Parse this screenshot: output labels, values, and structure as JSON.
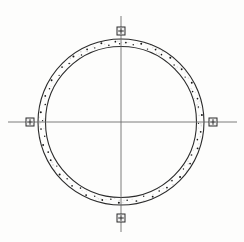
{
  "drawing": {
    "title": "Annular ring plan with centerlines and survey markers",
    "canvas": {
      "width": 244,
      "height": 242,
      "background": "#fdfdfc"
    },
    "center": {
      "x": 121,
      "y": 122
    },
    "colors": {
      "line": "#2b2b2b",
      "centerline": "#6e6e6e",
      "marker_fill": "#f2f2f2",
      "marker_stroke": "#2b2b2b",
      "dot": "#1a1a1a",
      "speckle": "#b9b9b9"
    },
    "outer_circle": {
      "label": "outer-circle",
      "radius": 83,
      "stroke_width": 1.1
    },
    "inner_circle": {
      "label": "inner-circle",
      "radius": 75.5,
      "stroke_width": 1.1
    },
    "centerlines": [
      {
        "label": "vertical-centerline",
        "x1": 121,
        "y1": 16,
        "x2": 121,
        "y2": 232,
        "width": 0.9
      },
      {
        "label": "horizontal-centerline",
        "x1": 8,
        "y1": 122,
        "x2": 237,
        "y2": 122,
        "width": 0.9
      }
    ],
    "markers": [
      {
        "label": "marker-north",
        "position": "top",
        "x": 121,
        "y": 31,
        "size": 8
      },
      {
        "label": "marker-south",
        "position": "bottom",
        "x": 121,
        "y": 218,
        "size": 8
      },
      {
        "label": "marker-west",
        "position": "left",
        "x": 30,
        "y": 122,
        "size": 8
      },
      {
        "label": "marker-east",
        "position": "right",
        "x": 213,
        "y": 122,
        "size": 8
      }
    ],
    "annulus_dots": {
      "label": "rebar-dots",
      "count": 62,
      "radius_range": [
        76.6,
        82.2
      ],
      "size_range": [
        1.1,
        2.1
      ],
      "points": [
        {
          "a": 3.5,
          "r": 79.6,
          "s": 1.8
        },
        {
          "a": 9.0,
          "r": 78.1,
          "s": 1.5
        },
        {
          "a": 14.5,
          "r": 80.8,
          "s": 1.9
        },
        {
          "a": 20.0,
          "r": 77.6,
          "s": 1.4
        },
        {
          "a": 25.5,
          "r": 80.2,
          "s": 1.7
        },
        {
          "a": 31.0,
          "r": 78.6,
          "s": 1.6
        },
        {
          "a": 37.5,
          "r": 81.0,
          "s": 2.0
        },
        {
          "a": 43.0,
          "r": 77.9,
          "s": 1.5
        },
        {
          "a": 49.0,
          "r": 80.4,
          "s": 1.8
        },
        {
          "a": 55.0,
          "r": 78.3,
          "s": 1.4
        },
        {
          "a": 61.0,
          "r": 80.9,
          "s": 1.9
        },
        {
          "a": 67.0,
          "r": 77.8,
          "s": 1.6
        },
        {
          "a": 73.0,
          "r": 80.0,
          "s": 1.7
        },
        {
          "a": 79.0,
          "r": 78.8,
          "s": 1.5
        },
        {
          "a": 85.0,
          "r": 81.2,
          "s": 2.0
        },
        {
          "a": 91.0,
          "r": 77.5,
          "s": 1.4
        },
        {
          "a": 97.0,
          "r": 80.3,
          "s": 1.8
        },
        {
          "a": 103.0,
          "r": 78.4,
          "s": 1.6
        },
        {
          "a": 109.0,
          "r": 81.0,
          "s": 1.9
        },
        {
          "a": 115.0,
          "r": 77.9,
          "s": 1.5
        },
        {
          "a": 121.0,
          "r": 80.6,
          "s": 1.7
        },
        {
          "a": 127.0,
          "r": 78.2,
          "s": 1.4
        },
        {
          "a": 133.0,
          "r": 80.8,
          "s": 2.0
        },
        {
          "a": 139.0,
          "r": 77.7,
          "s": 1.6
        },
        {
          "a": 145.0,
          "r": 80.1,
          "s": 1.8
        },
        {
          "a": 151.0,
          "r": 78.9,
          "s": 1.5
        },
        {
          "a": 157.0,
          "r": 81.1,
          "s": 1.9
        },
        {
          "a": 163.0,
          "r": 77.6,
          "s": 1.4
        },
        {
          "a": 169.0,
          "r": 80.5,
          "s": 1.7
        },
        {
          "a": 175.5,
          "r": 78.5,
          "s": 1.6
        },
        {
          "a": 181.5,
          "r": 80.9,
          "s": 2.0
        },
        {
          "a": 187.5,
          "r": 77.8,
          "s": 1.5
        },
        {
          "a": 193.5,
          "r": 80.2,
          "s": 1.8
        },
        {
          "a": 199.5,
          "r": 78.7,
          "s": 1.4
        },
        {
          "a": 205.5,
          "r": 81.0,
          "s": 1.9
        },
        {
          "a": 211.5,
          "r": 77.5,
          "s": 1.6
        },
        {
          "a": 217.5,
          "r": 80.4,
          "s": 1.7
        },
        {
          "a": 223.5,
          "r": 78.3,
          "s": 1.5
        },
        {
          "a": 229.5,
          "r": 80.7,
          "s": 2.0
        },
        {
          "a": 235.5,
          "r": 77.9,
          "s": 1.4
        },
        {
          "a": 241.5,
          "r": 80.0,
          "s": 1.8
        },
        {
          "a": 247.5,
          "r": 78.8,
          "s": 1.6
        },
        {
          "a": 253.5,
          "r": 81.2,
          "s": 1.9
        },
        {
          "a": 259.5,
          "r": 77.6,
          "s": 1.5
        },
        {
          "a": 265.0,
          "r": 80.3,
          "s": 1.7
        },
        {
          "a": 271.0,
          "r": 78.4,
          "s": 1.4
        },
        {
          "a": 277.0,
          "r": 80.8,
          "s": 2.0
        },
        {
          "a": 283.0,
          "r": 77.7,
          "s": 1.6
        },
        {
          "a": 289.0,
          "r": 80.1,
          "s": 1.8
        },
        {
          "a": 295.0,
          "r": 78.9,
          "s": 1.5
        },
        {
          "a": 301.0,
          "r": 81.0,
          "s": 1.9
        },
        {
          "a": 307.0,
          "r": 77.5,
          "s": 1.4
        },
        {
          "a": 313.0,
          "r": 80.6,
          "s": 1.7
        },
        {
          "a": 318.5,
          "r": 78.2,
          "s": 1.6
        },
        {
          "a": 324.0,
          "r": 80.9,
          "s": 2.0
        },
        {
          "a": 329.5,
          "r": 77.8,
          "s": 1.5
        },
        {
          "a": 335.0,
          "r": 80.2,
          "s": 1.8
        },
        {
          "a": 340.5,
          "r": 78.6,
          "s": 1.4
        },
        {
          "a": 346.0,
          "r": 81.1,
          "s": 1.9
        },
        {
          "a": 351.0,
          "r": 77.6,
          "s": 1.6
        },
        {
          "a": 356.0,
          "r": 80.5,
          "s": 1.7
        },
        {
          "a": 359.0,
          "r": 78.3,
          "s": 1.5
        }
      ]
    },
    "speckle": {
      "label": "scan-noise-speckle",
      "count": 150,
      "radius_range": [
        76.3,
        82.5
      ],
      "opacity": 0.45
    }
  }
}
